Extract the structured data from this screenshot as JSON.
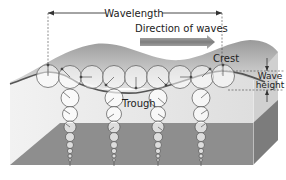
{
  "diagram": {
    "labels": {
      "wavelength": "Wavelength",
      "direction": "Direction of waves",
      "crest": "Crest",
      "trough": "Trough",
      "wave_height_line1": "Wave",
      "wave_height_line2": "height"
    },
    "colors": {
      "background": "#ffffff",
      "water_front": "#e6e6e6",
      "water_side": "#cfcfcf",
      "bottom_plane": "#8c8c8c",
      "bottom_side": "#7a7a7a",
      "wave_surface_back": "#a8a8a8",
      "surface_line": "#555555",
      "arrow_fill": "#8a8a8a",
      "circle_stroke": "#555555"
    },
    "surface_circles_count": 9,
    "orbit_columns_count": 4
  }
}
